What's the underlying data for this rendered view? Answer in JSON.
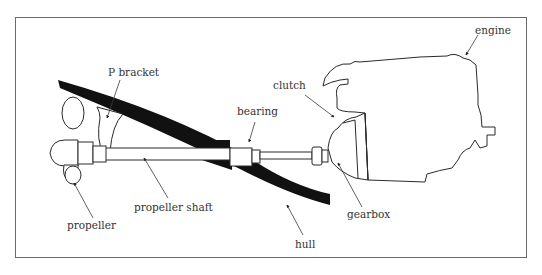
{
  "diagram": {
    "colors": {
      "line": "#2a2a2a",
      "hull_fill": "#111111",
      "frame": "#6a6a6a",
      "label_text": "#333333",
      "background": "#ffffff"
    },
    "labels": {
      "p_bracket": "P bracket",
      "bearing": "bearing",
      "clutch": "clutch",
      "engine": "engine",
      "propeller": "propeller",
      "propeller_shaft": "propeller shaft",
      "gearbox": "gearbox",
      "hull": "hull"
    },
    "components": [
      "propeller",
      "P bracket",
      "propeller shaft",
      "hull",
      "bearing",
      "clutch",
      "gearbox",
      "engine"
    ]
  }
}
